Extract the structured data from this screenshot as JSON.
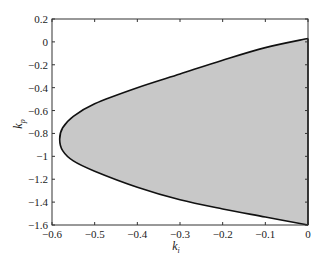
{
  "chart_data": {
    "type": "area",
    "title": "",
    "xlabel": "k_i",
    "ylabel": "k_p",
    "xlim": [
      -0.6,
      0
    ],
    "ylim": [
      -1.6,
      0.2
    ],
    "grid": false,
    "legend": null,
    "x_ticks": [
      "-0.6",
      "-0.5",
      "-0.4",
      "-0.3",
      "-0.2",
      "-0.1",
      "0"
    ],
    "y_ticks": [
      "0.2",
      "0",
      "-0.2",
      "-0.4",
      "-0.6",
      "-0.8",
      "-1",
      "-1.2",
      "-1.4",
      "-1.6"
    ],
    "fill_color": "#c8c8c8",
    "line_color": "#111111",
    "boundary": [
      [
        0,
        0.03
      ],
      [
        -0.1,
        -0.05
      ],
      [
        -0.2,
        -0.16
      ],
      [
        -0.3,
        -0.28
      ],
      [
        -0.4,
        -0.4
      ],
      [
        -0.5,
        -0.54
      ],
      [
        -0.55,
        -0.65
      ],
      [
        -0.575,
        -0.75
      ],
      [
        -0.582,
        -0.85
      ],
      [
        -0.575,
        -0.95
      ],
      [
        -0.55,
        -1.04
      ],
      [
        -0.5,
        -1.13
      ],
      [
        -0.4,
        -1.27
      ],
      [
        -0.3,
        -1.38
      ],
      [
        -0.2,
        -1.46
      ],
      [
        -0.1,
        -1.53
      ],
      [
        0,
        -1.6
      ]
    ]
  },
  "labels": {
    "xlabel_main": "k",
    "xlabel_sub": "i",
    "ylabel_main": "k",
    "ylabel_sub": "p"
  }
}
